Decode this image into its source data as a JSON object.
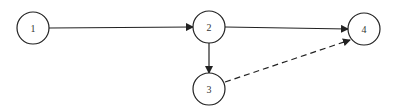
{
  "diagram": {
    "type": "directed-network",
    "nodes": [
      {
        "id": "1",
        "label": "1",
        "cx": 33,
        "cy": 28,
        "r": 16
      },
      {
        "id": "2",
        "label": "2",
        "cx": 209,
        "cy": 27,
        "r": 16
      },
      {
        "id": "3",
        "label": "3",
        "cx": 209,
        "cy": 89,
        "r": 16
      },
      {
        "id": "4",
        "label": "4",
        "cx": 364,
        "cy": 29,
        "r": 16
      }
    ],
    "edges": [
      {
        "from": "1",
        "to": "2",
        "style": "solid"
      },
      {
        "from": "2",
        "to": "4",
        "style": "solid"
      },
      {
        "from": "2",
        "to": "3",
        "style": "solid"
      },
      {
        "from": "3",
        "to": "4",
        "style": "dashed"
      }
    ],
    "colors": {
      "stroke": "#222222",
      "fill": "#ffffff"
    }
  }
}
